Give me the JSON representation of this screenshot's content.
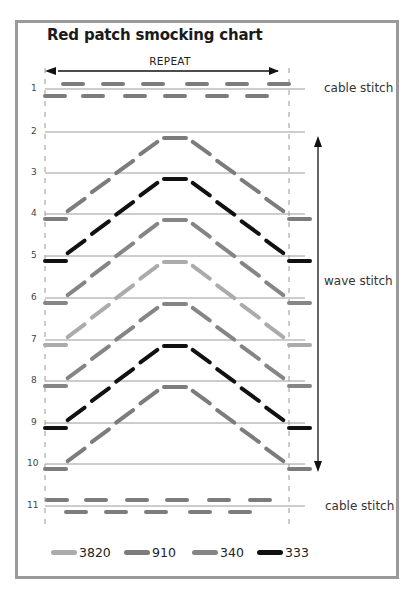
{
  "title": "Red patch smocking chart",
  "repeat_label": "REPEAT",
  "side_labels": {
    "cable_top": "cable stitch",
    "wave": "wave stitch",
    "cable_bottom": "cable stitch"
  },
  "colors": {
    "3820": "#ababab",
    "910": "#7c7c7c",
    "340": "#858585",
    "333": "#111111"
  },
  "legend": [
    {
      "code": "3820",
      "color": "#ababab"
    },
    {
      "code": "910",
      "color": "#7c7c7c"
    },
    {
      "code": "340",
      "color": "#858585"
    },
    {
      "code": "333",
      "color": "#111111"
    }
  ],
  "rows": [
    "1",
    "2",
    "3",
    "4",
    "5",
    "6",
    "7",
    "8",
    "9",
    "10",
    "11"
  ],
  "chart_data": {
    "type": "smocking-diagram",
    "title": "Red patch smocking chart",
    "rows": 11,
    "repeat": "REPEAT",
    "sections": [
      {
        "name": "cable stitch",
        "rows": [
          1
        ],
        "thread": "910"
      },
      {
        "name": "wave stitch",
        "rows": [
          2,
          10
        ]
      },
      {
        "name": "cable stitch",
        "rows": [
          11
        ],
        "thread": "910"
      }
    ],
    "wave_chevrons": [
      {
        "from_row": 2,
        "to_row": 4,
        "thread": "910"
      },
      {
        "from_row": 3,
        "to_row": 5,
        "thread": "333"
      },
      {
        "from_row": 4,
        "to_row": 6,
        "thread": "340"
      },
      {
        "from_row": 5,
        "to_row": 7,
        "thread": "3820"
      },
      {
        "from_row": 6,
        "to_row": 8,
        "thread": "340"
      },
      {
        "from_row": 7,
        "to_row": 9,
        "thread": "333"
      },
      {
        "from_row": 8,
        "to_row": 10,
        "thread": "910"
      }
    ],
    "legend": [
      "3820",
      "910",
      "340",
      "333"
    ]
  }
}
